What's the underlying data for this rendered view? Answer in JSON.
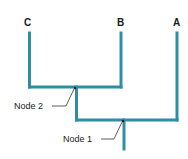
{
  "diagram": {
    "type": "cladogram",
    "branch_color": "#2f8ea5",
    "taxa": [
      {
        "id": "C",
        "label": "C"
      },
      {
        "id": "B",
        "label": "B"
      },
      {
        "id": "A",
        "label": "A"
      }
    ],
    "nodes": [
      {
        "id": "node2",
        "label": "Node 2",
        "joins": [
          "C",
          "B"
        ]
      },
      {
        "id": "node1",
        "label": "Node 1",
        "joins": [
          "node2",
          "A"
        ]
      }
    ]
  }
}
